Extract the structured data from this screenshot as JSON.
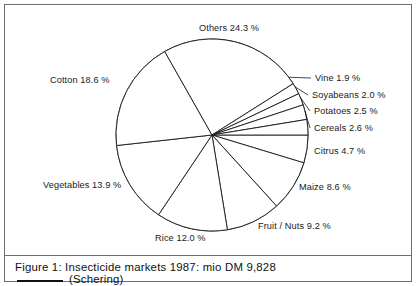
{
  "figure": {
    "caption_line_1": "Figure 1: Insecticide markets 1987: mio DM 9,828",
    "caption_line_2": "(Schering)",
    "caption_rule": "horizontal-rule"
  },
  "chart_data": {
    "type": "pie",
    "title": "Figure 1: Insecticide markets 1987: mio DM 9,828",
    "subtitle": "(Schering)",
    "unit": "%",
    "total_label": "mio DM 9,828",
    "year": "1987",
    "grid": false,
    "legend": "none",
    "labels_position": "outside-radial",
    "start_angle_deg": 0,
    "direction": "clockwise",
    "categories": [
      "Citrus",
      "Maize",
      "Fruit / Nuts",
      "Rice",
      "Vegetables",
      "Cotton",
      "Others",
      "Vine",
      "Soyabeans",
      "Potatoes",
      "Cereals"
    ],
    "values": [
      4.7,
      8.6,
      9.2,
      12.0,
      13.9,
      18.6,
      24.3,
      1.9,
      2.0,
      2.5,
      2.6
    ],
    "slices": [
      {
        "name": "Citrus",
        "value": 4.7,
        "label": "Citrus 4.7 %"
      },
      {
        "name": "Maize",
        "value": 8.6,
        "label": "Maize 8.6 %"
      },
      {
        "name": "Fruit / Nuts",
        "value": 9.2,
        "label": "Fruit / Nuts 9.2 %"
      },
      {
        "name": "Rice",
        "value": 12.0,
        "label": "Rice 12.0 %"
      },
      {
        "name": "Vegetables",
        "value": 13.9,
        "label": "Vegetables 13.9 %"
      },
      {
        "name": "Cotton",
        "value": 18.6,
        "label": "Cotton 18.6 %"
      },
      {
        "name": "Others",
        "value": 24.3,
        "label": "Others 24.3 %"
      },
      {
        "name": "Vine",
        "value": 1.9,
        "label": "Vine 1.9 %"
      },
      {
        "name": "Soyabeans",
        "value": 2.0,
        "label": "Soyabeans 2.0 %"
      },
      {
        "name": "Potatoes",
        "value": 2.5,
        "label": "Potatoes 2.5 %"
      },
      {
        "name": "Cereals",
        "value": 2.6,
        "label": "Cereals 2.6 %"
      }
    ],
    "colors": {
      "slice_fill": "#ffffff",
      "slice_stroke": "#1a1a1a",
      "text": "#1a1a1a",
      "frame": "#6f6f6f",
      "background": "#ffffff"
    }
  },
  "labels": {
    "others": "Others 24.3 %",
    "cotton": "Cotton 18.6 %",
    "vine": "Vine 1.9 %",
    "soyabeans": "Soyabeans 2.0 %",
    "potatoes": "Potatoes 2.5 %",
    "cereals": "Cereals 2.6 %",
    "citrus": "Citrus 4.7 %",
    "maize": "Maize 8.6 %",
    "fruit_nuts": "Fruit / Nuts 9.2 %",
    "rice": "Rice 12.0 %",
    "vegetables": "Vegetables 13.9 %"
  }
}
